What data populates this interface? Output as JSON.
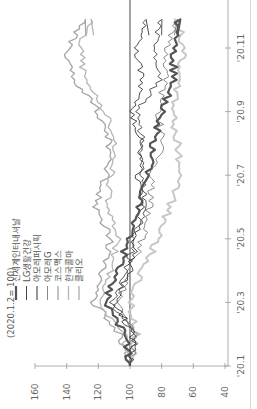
{
  "chart_data": {
    "type": "line",
    "orientation": "rotated-90-ccw",
    "title": "",
    "unit_note": "(2020.1.2= 100)",
    "xlabel": "",
    "ylabel": "",
    "x_ticks": [
      "'20.1",
      "'20.3",
      "'20.5",
      "'20.7",
      "'20.9",
      "'20.11"
    ],
    "y_ticks": [
      160,
      140,
      120,
      100,
      80,
      60,
      40
    ],
    "ylim": [
      40,
      160
    ],
    "reference_line": 100,
    "grid": false,
    "legend_position": "top-left (inside plot)",
    "x": [
      "'20.1",
      "'20.2",
      "'20.3",
      "'20.4",
      "'20.5",
      "'20.6",
      "'20.7",
      "'20.8",
      "'20.9",
      "'20.10",
      "'20.11",
      "'20.12"
    ],
    "series": [
      {
        "name": "신세계인터내셔날",
        "style": "thick dark",
        "color": "#555555",
        "width": 2.2,
        "values": [
          100,
          103,
          116,
          108,
          100,
          95,
          88,
          85,
          80,
          72,
          73,
          70
        ]
      },
      {
        "name": "LG생활건강",
        "style": "thin dark",
        "color": "#444444",
        "width": 0.9,
        "values": [
          100,
          97,
          112,
          102,
          98,
          90,
          93,
          92,
          95,
          82,
          84,
          80
        ]
      },
      {
        "name": "아모레퍼시픽",
        "style": "thin dark",
        "color": "#333333",
        "width": 0.9,
        "values": [
          100,
          98,
          110,
          100,
          96,
          92,
          95,
          92,
          100,
          92,
          96,
          88
        ]
      },
      {
        "name": "아모레G",
        "style": "thin gray",
        "color": "#8a8a8a",
        "width": 1.0,
        "values": [
          100,
          96,
          108,
          100,
          92,
          88,
          86,
          80,
          82,
          78,
          76,
          72
        ]
      },
      {
        "name": "코스맥스",
        "style": "medium gray",
        "color": "#a5a5a5",
        "width": 1.3,
        "values": [
          100,
          106,
          123,
          118,
          112,
          122,
          115,
          113,
          120,
          135,
          140,
          128
        ]
      },
      {
        "name": "한국콜마",
        "style": "light gray",
        "color": "#b5b5b5",
        "width": 1.3,
        "values": [
          100,
          104,
          120,
          112,
          108,
          114,
          112,
          110,
          116,
          128,
          132,
          123
        ]
      },
      {
        "name": "클리오",
        "style": "lightest thick",
        "color": "#c8c8c8",
        "width": 2.0,
        "values": [
          100,
          96,
          100,
          92,
          82,
          75,
          68,
          70,
          73,
          70,
          66,
          70
        ]
      }
    ]
  },
  "legend": {
    "unit_note": "(2020.1.2= 100)",
    "items": [
      {
        "label": "신세계인터내셔날",
        "color": "#555555",
        "width": 2.2
      },
      {
        "label": "LG생활건강",
        "color": "#444444",
        "width": 0.9
      },
      {
        "label": "아모레퍼시픽",
        "color": "#333333",
        "width": 0.9
      },
      {
        "label": "아모레G",
        "color": "#8a8a8a",
        "width": 1.0
      },
      {
        "label": "코스맥스",
        "color": "#a5a5a5",
        "width": 1.3
      },
      {
        "label": "한국콜마",
        "color": "#b5b5b5",
        "width": 1.3
      },
      {
        "label": "클리오",
        "color": "#c8c8c8",
        "width": 2.0
      }
    ]
  },
  "axes": {
    "value_ticks": [
      "160",
      "140",
      "120",
      "100",
      "80",
      "60",
      "40"
    ],
    "time_ticks": [
      "'20.1",
      "'20.3",
      "'20.5",
      "'20.7",
      "'20.9",
      "'20.11"
    ]
  }
}
